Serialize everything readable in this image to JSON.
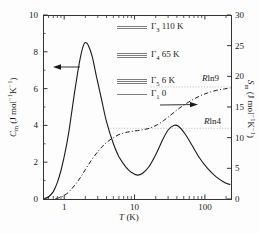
{
  "figure": {
    "background": "#fdfdfd",
    "ink": "#1a1a1a",
    "axis_color": "#333333",
    "level_line_color": "#7d7d7d",
    "reference_line_color": "#b5b5b5"
  },
  "chart_data": {
    "type": "line",
    "x_axis": {
      "scale": "log",
      "range": [
        0.5,
        235
      ],
      "ticks": [
        1,
        10,
        100
      ],
      "tick_labels": [
        "1",
        "10",
        "100"
      ],
      "label_parts": [
        {
          "t": "T",
          "s": "i"
        },
        {
          "t": " (K)"
        }
      ]
    },
    "left_axis": {
      "range": [
        0,
        10
      ],
      "major_ticks": [
        0,
        2,
        4,
        6,
        8,
        10
      ],
      "minor_ticks": [
        1,
        3,
        5,
        7,
        9
      ],
      "tick_labels": [
        "0",
        "2",
        "4",
        "6",
        "8",
        "10"
      ],
      "label_parts": [
        {
          "t": "C",
          "s": "i"
        },
        {
          "t": "m",
          "s": "sub"
        },
        {
          "t": " (J mol"
        },
        {
          "t": "−1",
          "s": "sup"
        },
        {
          "t": "K"
        },
        {
          "t": "−1",
          "s": "sup"
        },
        {
          "t": ")"
        }
      ]
    },
    "right_axis": {
      "range": [
        0,
        30
      ],
      "major_ticks": [
        0,
        5,
        10,
        15,
        20,
        25,
        30
      ],
      "tick_labels": [
        "0",
        "5",
        "10",
        "15",
        "20",
        "25",
        "30"
      ],
      "label_parts": [
        {
          "t": "S",
          "s": "i"
        },
        {
          "t": "m",
          "s": "sub"
        },
        {
          "t": " (J mol"
        },
        {
          "t": "−1",
          "s": "sup"
        },
        {
          "t": "K"
        },
        {
          "t": "−1",
          "s": "sup"
        },
        {
          "t": ")"
        }
      ]
    },
    "series": [
      {
        "name": "heat-capacity-Cm",
        "axis": "left",
        "style": "solid",
        "points": [
          [
            0.52,
            0.02
          ],
          [
            0.6,
            0.12
          ],
          [
            0.7,
            0.4
          ],
          [
            0.8,
            0.9
          ],
          [
            0.9,
            1.55
          ],
          [
            1.0,
            2.3
          ],
          [
            1.15,
            3.5
          ],
          [
            1.3,
            4.9
          ],
          [
            1.5,
            6.5
          ],
          [
            1.7,
            7.7
          ],
          [
            1.9,
            8.4
          ],
          [
            2.05,
            8.5
          ],
          [
            2.2,
            8.35
          ],
          [
            2.5,
            7.75
          ],
          [
            2.9,
            6.6
          ],
          [
            3.4,
            5.4
          ],
          [
            4.0,
            4.2
          ],
          [
            5.0,
            3.0
          ],
          [
            6.0,
            2.3
          ],
          [
            7.5,
            1.75
          ],
          [
            9.0,
            1.45
          ],
          [
            11,
            1.3
          ],
          [
            13,
            1.4
          ],
          [
            16,
            1.75
          ],
          [
            20,
            2.4
          ],
          [
            25,
            3.2
          ],
          [
            30,
            3.75
          ],
          [
            36,
            4.0
          ],
          [
            42,
            3.95
          ],
          [
            52,
            3.55
          ],
          [
            65,
            2.95
          ],
          [
            85,
            2.2
          ],
          [
            110,
            1.65
          ],
          [
            145,
            1.2
          ],
          [
            190,
            0.9
          ],
          [
            230,
            0.78
          ]
        ]
      },
      {
        "name": "entropy-Sm",
        "axis": "right",
        "style": "dashdot",
        "points": [
          [
            0.75,
            0.05
          ],
          [
            0.9,
            0.3
          ],
          [
            1.0,
            0.55
          ],
          [
            1.2,
            1.3
          ],
          [
            1.45,
            2.4
          ],
          [
            1.7,
            3.5
          ],
          [
            2.0,
            4.8
          ],
          [
            2.4,
            6.2
          ],
          [
            2.9,
            7.5
          ],
          [
            3.5,
            8.6
          ],
          [
            4.2,
            9.4
          ],
          [
            5.0,
            10.0
          ],
          [
            6.0,
            10.5
          ],
          [
            7.5,
            10.85
          ],
          [
            9.0,
            11.0
          ],
          [
            11,
            11.15
          ],
          [
            14,
            11.35
          ],
          [
            17,
            11.6
          ],
          [
            21,
            12.1
          ],
          [
            26,
            12.8
          ],
          [
            32,
            13.6
          ],
          [
            40,
            14.5
          ],
          [
            50,
            15.3
          ],
          [
            65,
            16.1
          ],
          [
            85,
            16.8
          ],
          [
            110,
            17.3
          ],
          [
            145,
            17.7
          ],
          [
            190,
            17.95
          ],
          [
            230,
            18.1
          ]
        ]
      }
    ],
    "reference_lines": [
      {
        "label": {
          "r": "R",
          "rest": "ln9"
        },
        "value": 18.27,
        "axis": "right",
        "x_start": 17
      },
      {
        "label": {
          "r": "R",
          "rest": "ln4"
        },
        "value": 11.53,
        "axis": "right",
        "x_start": 4.5
      }
    ],
    "legend": {
      "items": [
        {
          "sym": "Γ",
          "sub": "3",
          "value": "110 K",
          "lines": 2
        },
        {
          "sym": "Γ",
          "sub": "4",
          "value": "65 K",
          "lines": 3
        },
        {
          "sym": "Γ",
          "sub": "5",
          "value": "6 K",
          "lines": 3
        },
        {
          "sym": "Γ",
          "sub": "1",
          "value": "0",
          "lines": 1
        }
      ]
    },
    "arrows": [
      {
        "direction": "left",
        "meaning": "solid curve reads on left axis"
      },
      {
        "direction": "right",
        "meaning": "dash-dot curve reads on right axis"
      }
    ]
  }
}
